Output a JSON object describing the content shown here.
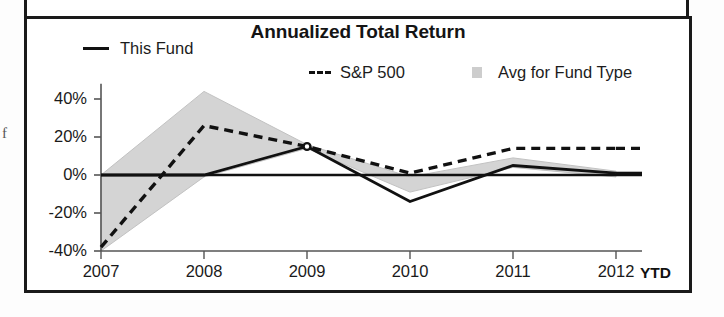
{
  "panel": {
    "name": "annualized-total-return-chart-panel",
    "margin_fragment_text": "f"
  },
  "chart": {
    "title": "Annualized Total Return",
    "legend": [
      {
        "key": "this-fund",
        "label": "This Fund",
        "style": "solid-line",
        "color": "#111111"
      },
      {
        "key": "sp500",
        "label": "S&P 500",
        "style": "dashed-line",
        "color": "#111111"
      },
      {
        "key": "avg-fund-type",
        "label": "Avg for Fund Type",
        "style": "filled-band",
        "color": "#cdcdcd"
      }
    ],
    "x_axis_suffix": "YTD"
  },
  "chart_data": {
    "type": "line",
    "title": "Annualized Total Return",
    "xlabel": "",
    "ylabel": "",
    "x": [
      "2007",
      "2008",
      "2009",
      "2010",
      "2011",
      "2012"
    ],
    "categories": [
      "2007",
      "2008",
      "2009",
      "2010",
      "2011",
      "2012"
    ],
    "xtick_labels": [
      "2007",
      "2008",
      "2009",
      "2010",
      "2011",
      "2012"
    ],
    "ytick_labels": [
      "40%",
      "20%",
      "0%",
      "-20%",
      "-40%"
    ],
    "ytick_values": [
      40,
      20,
      0,
      -20,
      -40
    ],
    "ylim": [
      -40,
      48
    ],
    "grid": false,
    "legend_position": "top",
    "series": [
      {
        "name": "This Fund",
        "style": "solid",
        "color": "#111111",
        "values": [
          0,
          0,
          15,
          -14,
          5,
          1
        ]
      },
      {
        "name": "S&P 500",
        "style": "dashed",
        "color": "#111111",
        "values": [
          -38,
          26,
          15,
          1,
          14,
          14
        ]
      },
      {
        "name": "Avg for Fund Type",
        "style": "band",
        "color": "#cdcdcd",
        "upper": [
          0,
          44,
          16,
          -1,
          9,
          2
        ],
        "lower": [
          -40,
          -1,
          14,
          -9,
          4,
          -1
        ]
      }
    ],
    "annotations": [
      {
        "text": "YTD",
        "x": "2012",
        "position": "after-last-xtick",
        "bold": true
      }
    ]
  }
}
